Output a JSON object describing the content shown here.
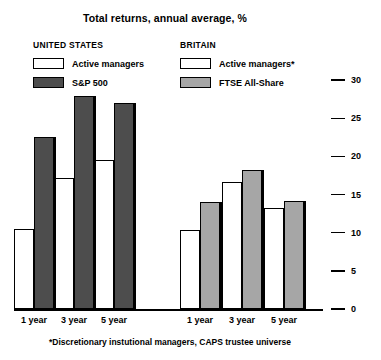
{
  "chart_data": {
    "type": "bar",
    "title": "Total returns, annual average, %",
    "xlabel": "",
    "ylabel": "",
    "ylim": [
      0,
      30
    ],
    "yticks": [
      0,
      5,
      10,
      15,
      20,
      25,
      30
    ],
    "ytick_labels": [
      "0",
      "5",
      "10",
      "15",
      "20",
      "25",
      "30"
    ],
    "grid": false,
    "legend_position": "top",
    "categories": [
      "1 year",
      "3 year",
      "5 year"
    ],
    "panels": [
      {
        "name": "UNITED STATES",
        "series": [
          {
            "name": "Active managers",
            "color": "#ffffff",
            "values": [
              10.5,
              17.2,
              19.6
            ]
          },
          {
            "name": "S&P 500",
            "color": "#4d4d4d",
            "values": [
              22.5,
              27.9,
              27.0
            ]
          }
        ]
      },
      {
        "name": "BRITAIN",
        "series": [
          {
            "name": "Active managers*",
            "color": "#ffffff",
            "values": [
              10.4,
              16.6,
              13.2
            ]
          },
          {
            "name": "FTSE All-Share",
            "color": "#a6a6a6",
            "values": [
              14.0,
              18.2,
              14.1
            ]
          }
        ]
      }
    ],
    "annotations": [
      "*Discretionary instutional managers, CAPS trustee universe"
    ]
  },
  "title": "Total returns, annual average, %",
  "legend": {
    "us": {
      "heading": "UNITED STATES",
      "items": [
        {
          "label": "Active managers",
          "swatch": "white-swatch"
        },
        {
          "label": "S&P 500",
          "swatch": "dark-grey-swatch"
        }
      ]
    },
    "uk": {
      "heading": "BRITAIN",
      "items": [
        {
          "label": "Active managers*",
          "swatch": "white-swatch"
        },
        {
          "label": "FTSE All-Share",
          "swatch": "light-grey-swatch"
        }
      ]
    }
  },
  "axis": {
    "y_labels": [
      "30",
      "25",
      "20",
      "15",
      "10",
      "5",
      "0"
    ],
    "x_labels_us": [
      "1 year",
      "3 year",
      "5 year"
    ],
    "x_labels_uk": [
      "1 year",
      "3 year",
      "5 year"
    ]
  },
  "footnote": "*Discretionary instutional managers, CAPS trustee universe",
  "colors": {
    "white_bar": "#ffffff",
    "dark_grey_bar": "#4d4d4d",
    "light_grey_bar": "#a6a6a6",
    "ink": "#000000",
    "background": "#ffffff"
  }
}
